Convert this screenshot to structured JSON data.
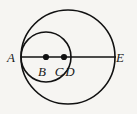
{
  "figure": {
    "kind": "geometry-diagram",
    "background_color": "#f6f5f2",
    "stroke_color": "#111111",
    "label_color": "#1a1a1a"
  },
  "shapes": {
    "large_circle": {
      "name": "large-circle",
      "cx": 68,
      "cy": 57,
      "r": 47,
      "stroke_width": 1.6
    },
    "small_circle": {
      "name": "small-circle",
      "cx": 46,
      "cy": 57,
      "r": 25,
      "stroke_width": 1.6
    },
    "diameter_line": {
      "name": "diameter-line-AE",
      "x1": 21,
      "y1": 57,
      "x2": 116,
      "y2": 57,
      "stroke_width": 1.7
    }
  },
  "dots": [
    {
      "id": "B",
      "cx": 46,
      "cy": 57,
      "r": 3.1
    },
    {
      "id": "C",
      "cx": 64,
      "cy": 57,
      "r": 3.1
    }
  ],
  "labels": {
    "a": {
      "text": "A",
      "x": 11,
      "y": 62
    },
    "b": {
      "text": "B",
      "x": 42,
      "y": 76
    },
    "c": {
      "text": "C",
      "x": 59,
      "y": 76
    },
    "d": {
      "text": "D",
      "x": 70,
      "y": 76
    },
    "e": {
      "text": "E",
      "x": 120,
      "y": 62
    }
  }
}
